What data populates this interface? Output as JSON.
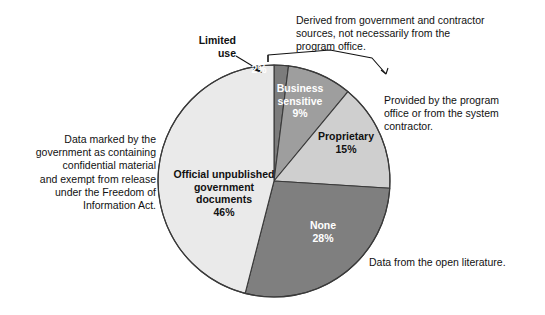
{
  "chart_data": {
    "type": "pie",
    "title": "",
    "subtitle": "",
    "xlabel": "",
    "ylabel": "",
    "grid": false,
    "legend_position": "none",
    "total_percent": 100,
    "center": {
      "x": 274,
      "y": 181,
      "radius": 116
    },
    "start_angle_deg": 0,
    "direction": "clockwise",
    "categories": [
      "Limited use",
      "Business sensitive",
      "Proprietary",
      "None",
      "Official unpublished government documents"
    ],
    "values": [
      2,
      9,
      15,
      28,
      46
    ],
    "value_labels": [
      "2%",
      "9%",
      "15%",
      "28%",
      "46%"
    ],
    "slices": [
      {
        "name": "Limited use",
        "label": "Limited\nuse",
        "value": 2,
        "value_label": "2%",
        "color": "#7c7c7c",
        "label_color": "#ffffff",
        "label_placement": "callout",
        "inside_text": "2%"
      },
      {
        "name": "Business sensitive",
        "label": "Business\nsensitive\n9%",
        "value": 9,
        "value_label": "9%",
        "color": "#9e9e9e",
        "label_color": "#ffffff",
        "label_placement": "inside"
      },
      {
        "name": "Proprietary",
        "label": "Proprietary\n15%",
        "value": 15,
        "value_label": "15%",
        "color": "#cfcfcf",
        "label_color": "#111111",
        "label_placement": "inside"
      },
      {
        "name": "None",
        "label": "None\n28%",
        "value": 28,
        "value_label": "28%",
        "color": "#7f7f7f",
        "label_color": "#ffffff",
        "label_placement": "inside"
      },
      {
        "name": "Official unpublished government documents",
        "label": "Official unpublished\ngovernment\ndocuments\n46%",
        "value": 46,
        "value_label": "46%",
        "color": "#eaeaea",
        "label_color": "#111111",
        "label_placement": "inside"
      }
    ],
    "annotations": [
      {
        "name": "annotation-derived-from-government",
        "text": "Derived from government and contractor\nsources, not necessarily from the\nprogram office.",
        "target": "Limited use + Business sensitive"
      },
      {
        "name": "annotation-provided-by-program-office",
        "text": "Provided by the program\noffice or from the system\ncontractor.",
        "target": "Proprietary"
      },
      {
        "name": "annotation-data-from-open-literature",
        "text": "Data from the open literature.",
        "target": "None"
      },
      {
        "name": "annotation-data-marked-by-government",
        "text": "Data marked by the\ngovernment as containing\nconfidential material\nand exempt from release\nunder the Freedom of\nInformation Act.",
        "target": "Official unpublished government documents"
      }
    ],
    "colors": {
      "limited_use": "#7c7c7c",
      "business_sensitive": "#9e9e9e",
      "proprietary": "#cfcfcf",
      "none": "#7f7f7f",
      "official_unpublished": "#eaeaea",
      "outline": "#3a3a3a",
      "background": "#ffffff",
      "text": "#111111"
    }
  }
}
